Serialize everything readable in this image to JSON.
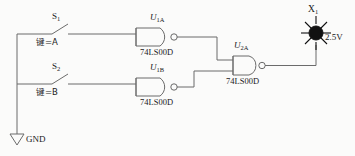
{
  "diagram": {
    "background_color": "#fbfbfa",
    "wire_color": "#6b6b6b"
  },
  "switches": [
    {
      "ref": "S",
      "ref_sub": "1",
      "key_label": "键=A",
      "state": "open"
    },
    {
      "ref": "S",
      "ref_sub": "2",
      "key_label": "键=B",
      "state": "open"
    }
  ],
  "gates": [
    {
      "ref": "U",
      "ref_sub": "1A",
      "part": "74LS00D",
      "type": "NAND",
      "inputs": 2
    },
    {
      "ref": "U",
      "ref_sub": "1B",
      "part": "74LS00D",
      "type": "NAND",
      "inputs": 2
    },
    {
      "ref": "U",
      "ref_sub": "2A",
      "part": "74LS00D",
      "type": "NAND",
      "inputs": 2
    }
  ],
  "lamp": {
    "ref": "X",
    "ref_sub": "1",
    "voltage": "2.5V",
    "color": "#111111"
  },
  "ground": {
    "label": "GND"
  }
}
